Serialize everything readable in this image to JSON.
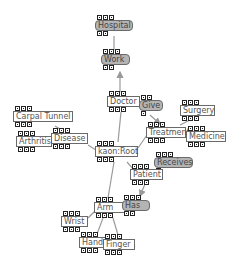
{
  "diagram": {
    "colors": {
      "edge": "#9a9a9a",
      "node_border": "#6a6a6a",
      "relation_fill": "#b4b4b4",
      "concept_fill": "#ffffff",
      "text": "#555555"
    },
    "nodes": [
      {
        "id": "hospital",
        "label": "Hospital",
        "kind": "relation",
        "x": 95,
        "y": 15,
        "w": 38,
        "top_buttons": 3,
        "bottom_buttons": 2
      },
      {
        "id": "work",
        "label": "Work",
        "kind": "relation",
        "x": 101,
        "y": 49,
        "w": 29,
        "top_buttons": 3,
        "bottom_buttons": 2
      },
      {
        "id": "doctor",
        "label": "Doctor",
        "kind": "concept",
        "x": 107,
        "y": 91,
        "w": 33,
        "top_buttons": 3,
        "bottom_buttons": 3
      },
      {
        "id": "give",
        "label": "Give",
        "kind": "relation",
        "x": 139,
        "y": 95,
        "w": 24,
        "top_buttons": 2,
        "bottom_buttons": 1
      },
      {
        "id": "carpal-tunnel",
        "label": "Carpal Tunnel",
        "kind": "concept",
        "x": 13,
        "y": 106,
        "w": 60,
        "top_buttons": 3,
        "bottom_buttons": 3
      },
      {
        "id": "surgery",
        "label": "Surgery",
        "kind": "concept",
        "x": 180,
        "y": 100,
        "w": 35,
        "top_buttons": 3,
        "bottom_buttons": 3
      },
      {
        "id": "treatment",
        "label": "Treatment",
        "kind": "concept",
        "x": 146,
        "y": 122,
        "w": 40,
        "top_buttons": 3,
        "bottom_buttons": 3
      },
      {
        "id": "medicine",
        "label": "Medicine",
        "kind": "concept",
        "x": 186,
        "y": 126,
        "w": 40,
        "top_buttons": 3,
        "bottom_buttons": 3
      },
      {
        "id": "arthritis",
        "label": "Arthritis",
        "kind": "concept",
        "x": 16,
        "y": 131,
        "w": 36,
        "top_buttons": 3,
        "bottom_buttons": 3
      },
      {
        "id": "disease",
        "label": "Disease",
        "kind": "concept",
        "x": 51,
        "y": 128,
        "w": 37,
        "top_buttons": 3,
        "bottom_buttons": 3
      },
      {
        "id": "kaon-root",
        "label": "kaon:Root",
        "kind": "concept",
        "x": 95,
        "y": 141,
        "w": 43,
        "top_buttons": 3,
        "bottom_buttons": 3
      },
      {
        "id": "receives",
        "label": "Receives",
        "kind": "relation",
        "x": 154,
        "y": 152,
        "w": 39,
        "top_buttons": 3,
        "bottom_buttons": 1
      },
      {
        "id": "patient",
        "label": "Patient",
        "kind": "concept",
        "x": 130,
        "y": 164,
        "w": 33,
        "top_buttons": 3,
        "bottom_buttons": 3
      },
      {
        "id": "arm",
        "label": "Arm",
        "kind": "concept",
        "x": 94,
        "y": 197,
        "w": 34,
        "top_buttons": 3,
        "bottom_buttons": 3
      },
      {
        "id": "has",
        "label": "Has",
        "kind": "relation",
        "x": 122,
        "y": 195,
        "w": 28,
        "top_buttons": 3,
        "bottom_buttons": 2
      },
      {
        "id": "wrist",
        "label": "Wrist",
        "kind": "concept",
        "x": 61,
        "y": 211,
        "w": 27,
        "top_buttons": 3,
        "bottom_buttons": 3
      },
      {
        "id": "hand",
        "label": "Hand",
        "kind": "concept",
        "x": 79,
        "y": 232,
        "w": 29,
        "top_buttons": 3,
        "bottom_buttons": 3
      },
      {
        "id": "finger",
        "label": "Finger",
        "kind": "concept",
        "x": 103,
        "y": 234,
        "w": 32,
        "top_buttons": 3,
        "bottom_buttons": 3
      }
    ],
    "edges": [
      {
        "from": "hospital",
        "to": "work",
        "points": [
          114,
          36,
          114,
          50
        ]
      },
      {
        "from": "doctor",
        "to": "work",
        "arrow": true,
        "points": [
          120,
          92,
          120,
          72
        ]
      },
      {
        "from": "kaon-root",
        "to": "doctor",
        "points": [
          118,
          142,
          121,
          112
        ]
      },
      {
        "from": "give",
        "to": "treatment",
        "arrow": true,
        "points": [
          150,
          115,
          160,
          124
        ]
      },
      {
        "from": "treatment",
        "to": "surgery",
        "points": [
          180,
          125,
          190,
          120
        ]
      },
      {
        "from": "treatment",
        "to": "medicine",
        "points": [
          185,
          133,
          188,
          135
        ]
      },
      {
        "from": "kaon-root",
        "to": "treatment",
        "points": [
          138,
          148,
          147,
          135
        ]
      },
      {
        "from": "kaon-root",
        "to": "disease",
        "points": [
          96,
          150,
          88,
          145
        ]
      },
      {
        "from": "disease",
        "to": "carpal-tunnel",
        "points": [
          60,
          129,
          55,
          126
        ]
      },
      {
        "from": "disease",
        "to": "arthritis",
        "points": [
          52,
          143,
          51,
          143
        ]
      },
      {
        "from": "kaon-root",
        "to": "patient",
        "points": [
          127,
          162,
          134,
          170
        ]
      },
      {
        "from": "patient",
        "to": "receives",
        "points": [
          160,
          168,
          162,
          166
        ]
      },
      {
        "from": "patient",
        "to": "has",
        "arrow": true,
        "points": [
          145,
          184,
          140,
          196
        ]
      },
      {
        "from": "kaon-root",
        "to": "arm",
        "points": [
          114,
          162,
          108,
          198
        ]
      },
      {
        "from": "arm",
        "to": "wrist",
        "points": [
          96,
          210,
          88,
          218
        ]
      },
      {
        "from": "arm",
        "to": "hand",
        "points": [
          103,
          218,
          97,
          234
        ]
      },
      {
        "from": "arm",
        "to": "finger",
        "points": [
          113,
          218,
          118,
          235
        ]
      }
    ]
  }
}
